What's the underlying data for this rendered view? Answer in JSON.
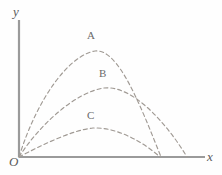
{
  "figure": {
    "background_color": "#fefefe",
    "axis_color": "#9a9a9a",
    "curve_color": "#a09a94",
    "label_color": "#6a6a6a"
  },
  "axes": {
    "y_label": "y",
    "x_label": "x",
    "origin_label": "O",
    "origin_px": {
      "x": 19,
      "y": 157
    },
    "x_axis_end_px": {
      "x": 205,
      "y": 157
    },
    "y_axis_end_px": {
      "x": 19,
      "y": 20
    }
  },
  "curves": [
    {
      "label": "A",
      "dash": "4 3",
      "start_px": {
        "x": 19,
        "y": 157
      },
      "apex_px": {
        "x": 95,
        "y": 51
      },
      "end_px": {
        "x": 161,
        "y": 157
      },
      "path": "M 19 157 C 38 96, 70 55, 95 51 C 118 48, 140 104, 161 157"
    },
    {
      "label": "B",
      "dash": "4 3",
      "start_px": {
        "x": 19,
        "y": 157
      },
      "apex_px": {
        "x": 104,
        "y": 88
      },
      "end_px": {
        "x": 187,
        "y": 157
      },
      "path": "M 19 157 C 40 124, 76 92, 104 88 C 132 85, 166 122, 187 157"
    },
    {
      "label": "C",
      "dash": "4 3",
      "start_px": {
        "x": 19,
        "y": 157
      },
      "apex_px": {
        "x": 93,
        "y": 128
      },
      "end_px": {
        "x": 160,
        "y": 157
      },
      "path": "M 19 157 C 40 146, 72 130, 93 128 C 116 127, 142 141, 160 157"
    }
  ],
  "chart_data": {
    "type": "line",
    "title": "",
    "xlabel": "x",
    "ylabel": "y",
    "grid": false,
    "legend": "inline-curve-labels",
    "series": [
      {
        "name": "A",
        "launch_point": [
          0,
          0
        ],
        "apex": [
          0.41,
          1.0
        ],
        "range": [
          0.76,
          0
        ],
        "max_height_relative": 1.0,
        "range_relative": 0.76
      },
      {
        "name": "B",
        "launch_point": [
          0,
          0
        ],
        "apex": [
          0.46,
          0.65
        ],
        "range": [
          1.0,
          0
        ],
        "max_height_relative": 0.65,
        "range_relative": 1.0
      },
      {
        "name": "C",
        "launch_point": [
          0,
          0
        ],
        "apex": [
          0.4,
          0.27
        ],
        "range": [
          0.75,
          0
        ],
        "max_height_relative": 0.27,
        "range_relative": 0.75
      }
    ],
    "xlim": [
      0,
      1.11
    ],
    "ylim": [
      0,
      1.29
    ]
  }
}
